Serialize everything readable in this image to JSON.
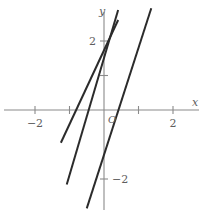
{
  "chart_data": {
    "type": "line",
    "title": "",
    "subtitle": "",
    "xlabel": "x",
    "ylabel": "y",
    "origin_label": "O",
    "grid": false,
    "legend": "none",
    "xlim": [
      -3.0,
      3.05
    ],
    "ylim": [
      -2.95,
      2.9
    ],
    "x_ticks": [
      -2,
      -1,
      1,
      2
    ],
    "y_ticks": [
      -2,
      1,
      2
    ],
    "x_tick_labels": [
      {
        "value": -2,
        "text": "−2"
      },
      {
        "value": 2,
        "text": "2"
      }
    ],
    "y_tick_labels": [
      {
        "value": 2,
        "text": "2"
      },
      {
        "value": -2,
        "text": "−2"
      }
    ],
    "axes": {
      "x_axis_label": "x",
      "y_axis_label": "y",
      "x_range_drawn": [
        -2.9,
        2.75
      ],
      "y_range_drawn": [
        -2.9,
        2.85
      ]
    },
    "series": [
      {
        "name": "line-left",
        "slope": 2.0,
        "intercept": 1.55,
        "x_start": -1.25,
        "x_end": 0.41,
        "y_start": -0.95,
        "y_end": 2.61
      },
      {
        "name": "line-middle",
        "slope": 2.0,
        "intercept": 0.0,
        "x_start": -1.08,
        "x_end": 0.41,
        "y_start": -2.16,
        "y_end": 2.9
      },
      {
        "name": "line-right",
        "slope": 2.0,
        "intercept": -1.55,
        "x_start": -0.5,
        "x_end": 1.37,
        "y_start": -2.85,
        "y_end": 2.95
      }
    ]
  }
}
